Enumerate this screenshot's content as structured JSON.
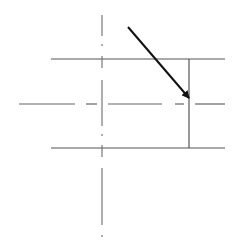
{
  "diagram": {
    "type": "technical-drawing",
    "colors": {
      "background": "#ffffff",
      "line": "#555555",
      "arrow": "#111111"
    },
    "rectangle": {
      "top_edge": {
        "x1": 51,
        "y1": 59,
        "x2": 225,
        "y2": 59
      },
      "bottom_edge": {
        "x1": 51,
        "y1": 148,
        "x2": 225,
        "y2": 148
      },
      "right_edge": {
        "x1": 189,
        "y1": 59,
        "x2": 189,
        "y2": 148
      }
    },
    "center_lines": {
      "vertical": {
        "x": 102,
        "segments": [
          [
            15,
            36
          ],
          [
            44,
            46
          ],
          [
            56,
            68
          ],
          [
            80,
            126
          ],
          [
            134,
            136
          ],
          [
            145,
            157
          ],
          [
            168,
            225
          ],
          [
            235,
            237
          ]
        ]
      },
      "horizontal": {
        "y": 104,
        "segments": [
          [
            19,
            75
          ],
          [
            86,
            97
          ],
          [
            108,
            162
          ],
          [
            175,
            184
          ],
          [
            195,
            225
          ]
        ]
      }
    },
    "arrow": {
      "x1": 128,
      "y1": 27,
      "x2": 189,
      "y2": 98
    }
  }
}
